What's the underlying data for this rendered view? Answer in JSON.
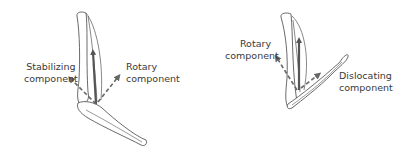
{
  "figures": [
    {
      "id": "left",
      "labels": {
        "stabilizing_line1": "Stabilizing",
        "stabilizing_line2": "component",
        "rotary_line1": "Rotary",
        "rotary_line2": "component"
      }
    },
    {
      "id": "right",
      "labels": {
        "rotary_line1": "Rotary",
        "rotary_line2": "component",
        "dislocating_line1": "Dislocating",
        "dislocating_line2": "component"
      }
    }
  ],
  "colors": {
    "bone_outline": "#444444",
    "force_arrow": "#555555",
    "component_arrow": "#666666",
    "text": "#3a3a3a"
  }
}
